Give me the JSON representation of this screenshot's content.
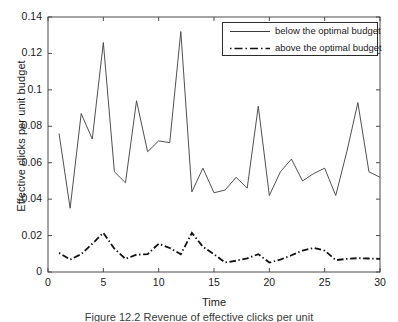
{
  "chart_data": {
    "type": "line",
    "title": "",
    "xlabel": "Time",
    "ylabel": "Effective clicks per unit budget",
    "xlim": [
      0,
      30
    ],
    "ylim": [
      0,
      0.14
    ],
    "xticks": [
      0,
      5,
      10,
      15,
      20,
      25,
      30
    ],
    "yticks": [
      0,
      0.02,
      0.04,
      0.06,
      0.08,
      0.1,
      0.12,
      0.14
    ],
    "xtick_labels": [
      "0",
      "5",
      "10",
      "15",
      "20",
      "25",
      "30"
    ],
    "ytick_labels": [
      "0",
      "0.02",
      "0.04",
      "0.06",
      "0.08",
      "0.1",
      "0.12",
      "0.14"
    ],
    "grid": false,
    "legend_position": "upper right",
    "x": [
      1,
      2,
      3,
      4,
      5,
      6,
      7,
      8,
      9,
      10,
      11,
      12,
      13,
      14,
      15,
      16,
      17,
      18,
      19,
      20,
      21,
      22,
      23,
      24,
      25,
      26,
      27,
      28,
      29,
      30
    ],
    "series": [
      {
        "name": "below the optimal budget",
        "style": "solid",
        "color": "#3c3c3c",
        "values": [
          0.076,
          0.035,
          0.087,
          0.073,
          0.126,
          0.055,
          0.049,
          0.094,
          0.066,
          0.072,
          0.071,
          0.132,
          0.044,
          0.057,
          0.0435,
          0.045,
          0.052,
          0.046,
          0.091,
          0.042,
          0.055,
          0.062,
          0.05,
          0.054,
          0.057,
          0.042,
          0.066,
          0.093,
          0.055,
          0.052
        ]
      },
      {
        "name": "above the optimal budget",
        "style": "dashdot",
        "color": "#111111",
        "values": [
          0.0105,
          0.0068,
          0.0098,
          0.0155,
          0.0215,
          0.0128,
          0.0072,
          0.0095,
          0.0098,
          0.0155,
          0.0132,
          0.0097,
          0.0215,
          0.0138,
          0.0098,
          0.0052,
          0.0062,
          0.0075,
          0.0098,
          0.0052,
          0.0068,
          0.0092,
          0.0118,
          0.0132,
          0.0118,
          0.0065,
          0.0072,
          0.0076,
          0.0074,
          0.0072
        ]
      }
    ]
  },
  "legend": {
    "entries": [
      {
        "label": "below the optimal budget"
      },
      {
        "label": "above the optimal budget"
      }
    ]
  },
  "caption": {
    "text": "Figure 12.2  Revenue of effective clicks per unit"
  }
}
